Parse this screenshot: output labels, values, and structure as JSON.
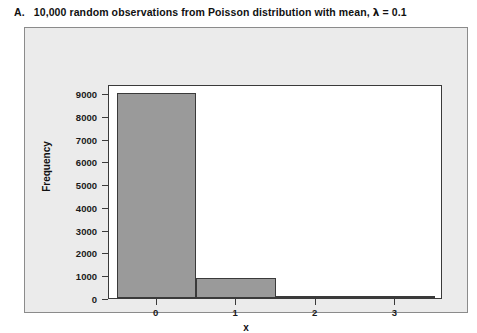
{
  "caption": {
    "prefix": "A.",
    "text_before_lambda": "10,000 random observations from Poisson distribution with mean,",
    "lambda_symbol": "λ",
    "lambda_equals": "= 0.1",
    "full": "A.  10,000 random observations from Poisson distribution with mean, λ = 0.1"
  },
  "colors": {
    "bar_fill": "#9a9a9a",
    "bar_edge": "#3a3a3a",
    "plot_background": "#ffffff",
    "panel_background": "#ebebeb",
    "panel_border": "#8b8b8b",
    "text": "#111111"
  },
  "chart_data": {
    "type": "bar",
    "xlabel": "x",
    "ylabel": "Frequency",
    "categories": [
      "0",
      "1",
      "2",
      "3"
    ],
    "x": [
      0,
      1,
      2,
      3
    ],
    "values": [
      9000,
      900,
      45,
      5
    ],
    "bar_width": 1,
    "xlim": [
      -0.6,
      3.6
    ],
    "ylim": [
      0,
      9400
    ],
    "xticks": [
      0,
      1,
      2,
      3
    ],
    "xtick_labels": [
      "0",
      "1",
      "2",
      "3"
    ],
    "yticks": [
      0,
      1000,
      2000,
      3000,
      4000,
      5000,
      6000,
      7000,
      8000,
      9000
    ],
    "ytick_labels": [
      "0",
      "1000",
      "2000",
      "3000",
      "4000",
      "5000",
      "6000",
      "7000",
      "8000",
      "9000"
    ],
    "grid": false,
    "legend": null,
    "distribution": "Poisson",
    "lambda": 0.1,
    "n_observations": 10000
  }
}
